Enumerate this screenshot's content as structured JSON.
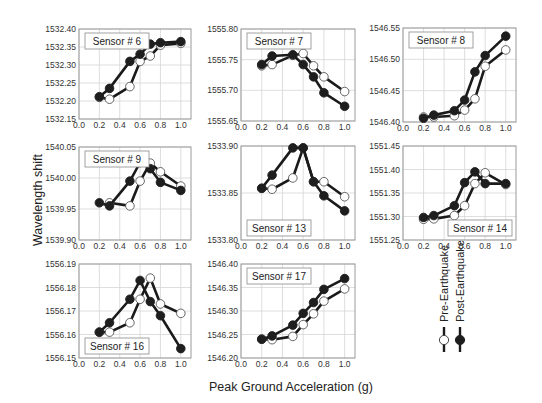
{
  "chart_data": {
    "type": "line",
    "xlabel": "Peak Ground Acceleration (g)",
    "ylabel": "Wavelength shift",
    "legend": {
      "position": "right-bottom, vertical",
      "entries": [
        {
          "name": "Pre-Earthquake",
          "marker": "open-circle"
        },
        {
          "name": "Post-Earthquake",
          "marker": "filled-circle"
        }
      ]
    },
    "x": [
      0.2,
      0.3,
      0.5,
      0.6,
      0.7,
      0.8,
      1.0
    ],
    "xlim": [
      0.0,
      1.1
    ],
    "xticks": [
      "0.0",
      "0.2",
      "0.4",
      "0.6",
      "0.8",
      "1.0"
    ],
    "grid": true,
    "panels": [
      {
        "title": "Sensor # 6",
        "label_pos": "top-left",
        "ylim": [
          1532.15,
          1532.4
        ],
        "yticks": [
          "1532.15",
          "1532.20",
          "1532.25",
          "1532.30",
          "1532.35",
          "1532.40"
        ],
        "series": [
          {
            "name": "Pre-Earthquake",
            "values": [
              1532.21,
              1532.205,
              1532.24,
              1532.31,
              1532.325,
              1532.355,
              1532.36
            ]
          },
          {
            "name": "Post-Earthquake",
            "values": [
              1532.212,
              1532.235,
              1532.31,
              1532.33,
              1532.358,
              1532.362,
              1532.365
            ]
          }
        ]
      },
      {
        "title": "Sensor # 7",
        "label_pos": "top-left",
        "ylim": [
          1555.65,
          1555.8
        ],
        "yticks": [
          "1555.65",
          "1555.70",
          "1555.75",
          "1555.80"
        ],
        "series": [
          {
            "name": "Pre-Earthquake",
            "values": [
              1555.74,
              1555.742,
              1555.757,
              1555.76,
              1555.74,
              1555.722,
              1555.698
            ]
          },
          {
            "name": "Post-Earthquake",
            "values": [
              1555.742,
              1555.756,
              1555.758,
              1555.742,
              1555.722,
              1555.696,
              1555.674
            ]
          }
        ]
      },
      {
        "title": "Sensor # 8",
        "label_pos": "top-left",
        "ylim": [
          1546.4,
          1546.55
        ],
        "yticks": [
          "1546.40",
          "1546.45",
          "1546.50",
          "1546.55"
        ],
        "series": [
          {
            "name": "Pre-Earthquake",
            "values": [
              1546.408,
              1546.408,
              1546.41,
              1546.419,
              1546.437,
              1546.489,
              1546.515
            ]
          },
          {
            "name": "Post-Earthquake",
            "values": [
              1546.406,
              1546.411,
              1546.418,
              1546.435,
              1546.48,
              1546.506,
              1546.537
            ]
          }
        ]
      },
      {
        "title": "Sensor # 9",
        "label_pos": "top-left",
        "ylim": [
          1539.9,
          1540.05
        ],
        "yticks": [
          "1539.90",
          "1539.95",
          "1540.00",
          "1540.05"
        ],
        "series": [
          {
            "name": "Pre-Earthquake",
            "x": [
              0.3,
              0.5,
              0.6,
              0.7,
              0.8,
              1.0
            ],
            "values": [
              1539.96,
              1539.955,
              1539.995,
              1540.024,
              1540.01,
              1539.987
            ]
          },
          {
            "name": "Post-Earthquake",
            "values": [
              1539.96,
              1539.955,
              1539.995,
              1540.025,
              1540.015,
              1539.993,
              1539.98
            ]
          }
        ]
      },
      {
        "title": "Sensor # 13",
        "label_pos": "bottom-left",
        "ylim": [
          1533.8,
          1533.9
        ],
        "yticks": [
          "1533.80",
          "1533.85",
          "1533.90"
        ],
        "series": [
          {
            "name": "Pre-Earthquake",
            "values": [
              1533.855,
              1533.854,
              1533.866,
              1533.898,
              1533.862,
              1533.862,
              1533.846
            ]
          },
          {
            "name": "Post-Earthquake",
            "values": [
              1533.855,
              1533.869,
              1533.898,
              1533.898,
              1533.862,
              1533.847,
              1533.831
            ]
          }
        ]
      },
      {
        "title": "Sensor # 14",
        "label_pos": "bottom-right",
        "ylim": [
          1551.25,
          1551.45
        ],
        "yticks": [
          "1551.25",
          "1551.30",
          "1551.35",
          "1551.40",
          "1551.45"
        ],
        "series": [
          {
            "name": "Pre-Earthquake",
            "values": [
              1551.294,
              1551.295,
              1551.302,
              1551.323,
              1551.37,
              1551.393,
              1551.368
            ]
          },
          {
            "name": "Post-Earthquake",
            "values": [
              1551.298,
              1551.302,
              1551.323,
              1551.372,
              1551.395,
              1551.37,
              1551.37
            ]
          }
        ]
      },
      {
        "title": "Sensor # 16",
        "label_pos": "bottom-left",
        "ylim": [
          1556.15,
          1556.19
        ],
        "yticks": [
          "1556.15",
          "1556.16",
          "1556.17",
          "1556.18",
          "1556.19"
        ],
        "series": [
          {
            "name": "Pre-Earthquake",
            "values": [
              1556.161,
              1556.161,
              1556.165,
              1556.175,
              1556.184,
              1556.173,
              1556.169
            ]
          },
          {
            "name": "Post-Earthquake",
            "values": [
              1556.161,
              1556.165,
              1556.175,
              1556.183,
              1556.174,
              1556.168,
              1556.154
            ]
          }
        ]
      },
      {
        "title": "Sensor # 17",
        "label_pos": "top-left",
        "ylim": [
          1546.2,
          1546.4
        ],
        "yticks": [
          "1546.20",
          "1546.25",
          "1546.30",
          "1546.35",
          "1546.40"
        ],
        "series": [
          {
            "name": "Pre-Earthquake",
            "values": [
              1546.24,
              1546.239,
              1546.246,
              1546.271,
              1546.294,
              1546.321,
              1546.347
            ]
          },
          {
            "name": "Post-Earthquake",
            "values": [
              1546.24,
              1546.247,
              1546.27,
              1546.295,
              1546.318,
              1546.346,
              1546.369
            ]
          }
        ]
      }
    ]
  },
  "layout": {
    "boxes": [
      {
        "l": 79,
        "t": 29,
        "w": 112,
        "h": 90
      },
      {
        "l": 241,
        "t": 29,
        "w": 114,
        "h": 92
      },
      {
        "l": 403,
        "t": 28,
        "w": 113,
        "h": 94
      },
      {
        "l": 79,
        "t": 147,
        "w": 112,
        "h": 93
      },
      {
        "l": 241,
        "t": 146,
        "w": 114,
        "h": 94
      },
      {
        "l": 403,
        "t": 146,
        "w": 113,
        "h": 94
      },
      {
        "l": 79,
        "t": 264,
        "w": 112,
        "h": 94
      },
      {
        "l": 241,
        "t": 264,
        "w": 114,
        "h": 94
      }
    ]
  },
  "colors": {
    "post_fill": "#1e1e1e",
    "pre_fill": "#ffffff",
    "line": "#1a1a1a",
    "grid": "#d6d6d6",
    "axis": "#9a9a9a",
    "text": "#333333"
  }
}
